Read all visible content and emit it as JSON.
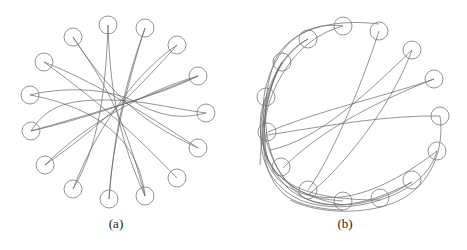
{
  "figure": {
    "panels": [
      {
        "id": "a",
        "caption": "(a)",
        "description": "15 circles arranged in a ring with trajectories crossing through the center",
        "circle_radius": 9,
        "circles": [
          [
            108,
            25
          ],
          [
            145,
            28
          ],
          [
            73,
            37
          ],
          [
            177,
            45
          ],
          [
            44,
            62
          ],
          [
            198,
            76
          ],
          [
            30,
            95
          ],
          [
            206,
            113
          ],
          [
            31,
            131
          ],
          [
            198,
            148
          ],
          [
            45,
            165
          ],
          [
            177,
            178
          ],
          [
            73,
            189
          ],
          [
            109,
            199
          ],
          [
            145,
            196
          ]
        ],
        "paths": [
          "M73,37 C95,70 120,100 145,196",
          "M145,28 C130,70 115,120 109,199",
          "M108,25 C110,80 115,130 145,196",
          "M177,45 C140,70 100,120 73,189",
          "M44,62 C90,80 140,110 198,148",
          "M198,76 C150,90 90,120 45,165",
          "M30,95 C70,85 120,90 140,105 C160,115 180,120 206,113",
          "M206,113 C170,108 140,100 110,100 C80,100 50,100 31,131",
          "M31,131 C80,120 140,100 198,76",
          "M198,148 C160,130 120,110 73,37",
          "M45,165 C80,140 120,110 177,45",
          "M177,178 C140,140 110,110 44,62",
          "M73,189 C90,160 105,120 108,25",
          "M109,199 C112,150 125,90 145,28",
          "M145,196 C140,150 110,110 30,95",
          "M198,76 C170,90 140,100 31,131"
        ]
      },
      {
        "id": "b",
        "caption": "(b)",
        "description": "15 circles arranged in a C-shaped arc with trajectories bundled along the left and bottom",
        "circle_radius": 9,
        "circles": [
          [
            343,
            26
          ],
          [
            379,
            31
          ],
          [
            308,
            39
          ],
          [
            412,
            50
          ],
          [
            282,
            62
          ],
          [
            434,
            79
          ],
          [
            266,
            97
          ],
          [
            440,
            116
          ],
          [
            267,
            132
          ],
          [
            437,
            151
          ],
          [
            281,
            167
          ],
          [
            412,
            180
          ],
          [
            308,
            190
          ],
          [
            343,
            201
          ],
          [
            380,
            198
          ]
        ],
        "paths": [
          "M379,31 C360,90 330,160 308,190",
          "M412,50 C370,90 320,140 270,150",
          "M412,50 C390,110 340,170 308,195",
          "M434,79 C390,95 320,110 268,132",
          "M434,79 C380,100 320,130 283,168",
          "M440,116 C390,115 330,125 268,135",
          "M440,116 C445,150 430,185 400,200 C370,215 320,215 290,200",
          "M343,26 C300,20 275,50 265,90 C258,130 270,170 300,195 C320,210 360,210 412,182",
          "M379,24 C330,18 290,30 275,60 C260,100 262,150 285,180 C310,205 360,210 437,151",
          "M308,39 C280,55 265,90 262,130 C262,170 290,195 343,205",
          "M282,62 C265,95 260,130 268,160 C280,185 310,200 380,200",
          "M343,26 C310,35 285,60 270,100 C258,140 262,175 285,195 C300,207 330,210 343,210",
          "M266,97 C255,120 258,160 290,190 C320,212 370,210 412,182",
          "M308,39 C285,50 268,80 262,115 C256,160 270,185 300,200",
          "M267,132 C262,150 265,170 285,185 C305,198 330,200 343,201",
          "M282,62 C270,80 262,120 260,165",
          "M437,151 C430,175 410,190 380,200 C350,210 320,208 300,200"
        ]
      }
    ]
  },
  "style": {
    "stroke_color": "#666666",
    "circle_color": "#777777",
    "background": "#ffffff"
  }
}
